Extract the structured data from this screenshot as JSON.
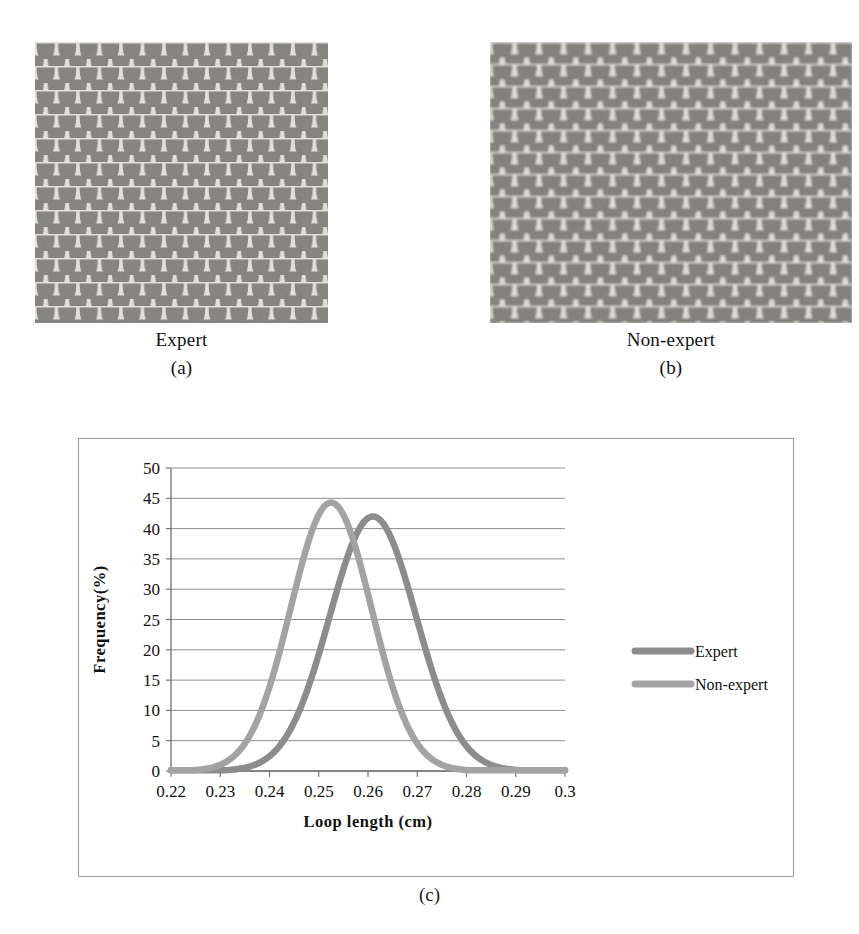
{
  "figures": [
    {
      "id": "expert-fabric",
      "caption": "Expert",
      "sublabel": "(a)",
      "alt_name": "knitted-fabric-micrograph-expert"
    },
    {
      "id": "non-expert-fabric",
      "caption": "Non-expert",
      "sublabel": "(b)",
      "alt_name": "knitted-fabric-micrograph-non-expert"
    }
  ],
  "chart_caption": "(c)",
  "chart_data": {
    "type": "line",
    "title": "",
    "xlabel": "Loop length (cm)",
    "ylabel": "Frequency(%)",
    "xlim": [
      0.22,
      0.3
    ],
    "ylim": [
      0,
      50
    ],
    "xticks": [
      "0.22",
      "0.23",
      "0.24",
      "0.25",
      "0.26",
      "0.27",
      "0.28",
      "0.29",
      "0.3"
    ],
    "yticks": [
      "0",
      "5",
      "10",
      "15",
      "20",
      "25",
      "30",
      "35",
      "40",
      "45",
      "50"
    ],
    "grid": "horizontal",
    "legend_position": "right",
    "series": [
      {
        "name": "Expert",
        "color": "#8c8c8c",
        "peak_x": 0.261,
        "peak_y": 42.0,
        "sigma": 0.0088,
        "x": [
          0.22,
          0.225,
          0.23,
          0.235,
          0.24,
          0.245,
          0.25,
          0.255,
          0.258,
          0.261,
          0.264,
          0.267,
          0.27,
          0.275,
          0.28,
          0.285,
          0.29,
          0.295,
          0.3
        ],
        "values": [
          0.1,
          0.2,
          0.5,
          1.2,
          3.0,
          7.2,
          15.6,
          28.5,
          36.2,
          42.0,
          40.4,
          34.1,
          26.0,
          13.5,
          5.4,
          1.7,
          0.6,
          0.2,
          0.1
        ]
      },
      {
        "name": "Non-expert",
        "color": "#a3a3a3",
        "peak_x": 0.2525,
        "peak_y": 44.3,
        "sigma": 0.0082,
        "x": [
          0.22,
          0.225,
          0.23,
          0.235,
          0.24,
          0.2425,
          0.245,
          0.2475,
          0.25,
          0.2525,
          0.255,
          0.258,
          0.26,
          0.265,
          0.27,
          0.275,
          0.28,
          0.285,
          0.29,
          0.295,
          0.3
        ],
        "values": [
          0.2,
          0.5,
          1.4,
          4.0,
          12.8,
          19.5,
          28.0,
          36.0,
          41.8,
          44.3,
          42.6,
          36.0,
          30.5,
          16.0,
          6.4,
          2.0,
          0.7,
          0.3,
          0.2,
          0.1,
          0.1
        ]
      }
    ],
    "legend": [
      {
        "label": "Expert",
        "color": "#8c8c8c"
      },
      {
        "label": "Non-expert",
        "color": "#a3a3a3"
      }
    ]
  },
  "colors": {
    "frame_border": "#9a9a9a",
    "gridline": "#8f8f8f",
    "axis": "#6e6e6e",
    "text": "#111111",
    "fabric_yarn": "#ddd9d4",
    "fabric_gap": "#7d7b79"
  }
}
